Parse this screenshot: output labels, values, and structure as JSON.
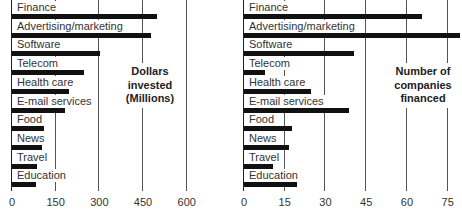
{
  "chart_data": [
    {
      "type": "bar",
      "orientation": "horizontal",
      "title": "Dollars invested (Millions)",
      "annotation_lines": [
        "Dollars",
        "invested",
        "(Millions)"
      ],
      "categories": [
        "Finance",
        "Advertising/marketing",
        "Software",
        "Telecom",
        "Health care",
        "E-mail services",
        "Food",
        "News",
        "Travel",
        "Education"
      ],
      "values": [
        500,
        480,
        305,
        250,
        200,
        185,
        115,
        105,
        90,
        85
      ],
      "xlabel": "",
      "ylabel": "",
      "xlim": [
        0,
        600
      ],
      "xticks": [
        "0",
        "150",
        "300",
        "450",
        "600"
      ],
      "grid": true
    },
    {
      "type": "bar",
      "orientation": "horizontal",
      "title": "Number of companies financed",
      "annotation_lines": [
        "Number of",
        "companies",
        "financed"
      ],
      "categories": [
        "Finance",
        "Advertising/marketing",
        "Software",
        "Telecom",
        "Health care",
        "E-mail services",
        "Food",
        "News",
        "Travel",
        "Education"
      ],
      "values": [
        66,
        80,
        41,
        8,
        25,
        39,
        18,
        17,
        11,
        20
      ],
      "xlabel": "",
      "ylabel": "",
      "xlim": [
        0,
        75
      ],
      "xticks": [
        "0",
        "15",
        "30",
        "45",
        "60",
        "75"
      ],
      "grid": true
    }
  ]
}
